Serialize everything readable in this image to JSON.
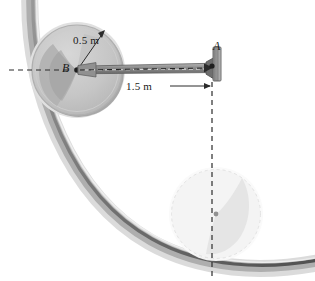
{
  "figure": {
    "kind": "engineering-mechanics-diagram",
    "labels": {
      "point_a": "A",
      "point_b": "B",
      "disk_radius": "0.5 m",
      "rod_length": "1.5 m"
    },
    "colors": {
      "ink": "#1a1a1a",
      "disk_fill": "#c9c9c9",
      "disk_rim": "#b3b3b3",
      "disk_outer_halo": "#dcdcdc",
      "disk_shadow": "#a6a6a6",
      "rod_fill": "#9a9a9a",
      "support_fill": "#8f8f8f",
      "surface_shadow": "#6f6f6f",
      "ghost_disk": "#ededed",
      "background": "#ffffff"
    },
    "geometry": {
      "pivot_a": {
        "x": 212,
        "y": 66
      },
      "disk_center_b": {
        "x": 77,
        "y": 70
      },
      "disk_radius_px": 45,
      "ghost_center": {
        "x": 216,
        "y": 214
      },
      "ghost_radius_px": 45,
      "arc_label_note": "large concave circular surface arc"
    },
    "annotations": {
      "radius_leader": "arrow from B to disk rim (upper right)",
      "dimension_line": "double-arrow horizontal dimension between B and A verticals",
      "centerline_horizontal": "dashed horizontal centerline through B and A",
      "centerline_vertical": "dashed vertical centerline from A down through ghost disk center"
    }
  }
}
